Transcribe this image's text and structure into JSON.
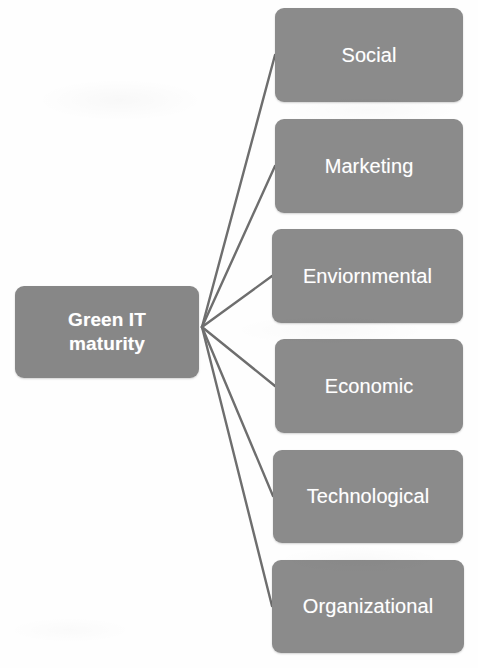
{
  "diagram": {
    "title": "Green IT maturity",
    "type": "radial-node-link",
    "colors": {
      "node_fill": "#8b8b8b",
      "node_text": "#ffffff",
      "connector": "#6e6e6e",
      "background": "#fefefe"
    },
    "root": {
      "id": "green-it-maturity",
      "label": "Green IT maturity",
      "label_line1": "Green IT",
      "label_line2": "maturity"
    },
    "hub": {
      "x": 202,
      "y": 327
    },
    "branches": [
      {
        "id": "social",
        "label": "Social",
        "anchor_x": 275,
        "anchor_y": 55
      },
      {
        "id": "marketing",
        "label": "Marketing",
        "anchor_x": 275,
        "anchor_y": 166
      },
      {
        "id": "environmental",
        "label": "Enviornmental",
        "anchor_x": 272,
        "anchor_y": 276
      },
      {
        "id": "economic",
        "label": "Economic",
        "anchor_x": 275,
        "anchor_y": 386
      },
      {
        "id": "technological",
        "label": "Technological",
        "anchor_x": 273,
        "anchor_y": 496
      },
      {
        "id": "organizational",
        "label": "Organizational",
        "anchor_x": 272,
        "anchor_y": 606
      }
    ]
  }
}
